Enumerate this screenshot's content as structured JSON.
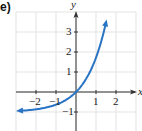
{
  "part_label": "e)",
  "colors": {
    "curve": "#2a74c5",
    "grid": "#e3e3e3",
    "axis": "#333333"
  },
  "chart_data": {
    "type": "line",
    "title": "",
    "xlabel": "x",
    "ylabel": "y",
    "xlim": [
      -3,
      3
    ],
    "ylim": [
      -2,
      4
    ],
    "grid": true,
    "x_ticks": [
      -2,
      -1,
      1,
      2
    ],
    "y_ticks": [
      3,
      2,
      1,
      -1
    ],
    "tick_labels": {
      "x": [
        "−2",
        "−1",
        "1",
        "2"
      ],
      "y": [
        "3",
        "2",
        "1",
        "−1"
      ]
    },
    "series": [
      {
        "name": "y = e^x − 1",
        "x": [
          -3.0,
          -2.5,
          -2.0,
          -1.5,
          -1.0,
          -0.5,
          0.0,
          0.5,
          1.0,
          1.25,
          1.5,
          1.6
        ],
        "y": [
          -0.95,
          -0.92,
          -0.86,
          -0.78,
          -0.63,
          -0.39,
          0.0,
          0.65,
          1.72,
          2.49,
          3.48,
          3.95
        ],
        "arrows": [
          "left",
          "right"
        ]
      }
    ],
    "horizontal_asymptote": -1
  }
}
